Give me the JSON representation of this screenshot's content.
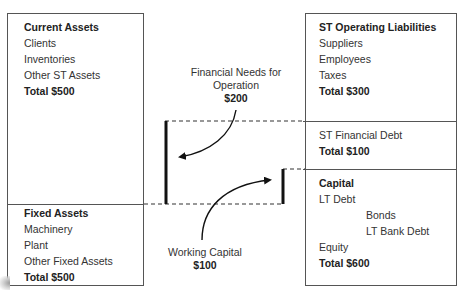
{
  "assets": {
    "current": {
      "title": "Current Assets",
      "items": [
        "Clients",
        "Inventories",
        "Other ST Assets"
      ],
      "total": "Total $500"
    },
    "fixed": {
      "title": "Fixed Assets",
      "items": [
        "Machinery",
        "Plant",
        "Other Fixed Assets"
      ],
      "total": "Total $500"
    }
  },
  "liabilities": {
    "st_operating": {
      "title": "ST Operating Liabilities",
      "items": [
        "Suppliers",
        "Employees",
        "Taxes"
      ],
      "total": "Total $300"
    },
    "st_financial": {
      "items": [
        "ST Financial Debt"
      ],
      "total": "Total $100"
    },
    "capital": {
      "title": "Capital",
      "items": [
        "LT Debt",
        "Bonds",
        "LT Bank Debt",
        "Equity"
      ],
      "total": "Total $600"
    }
  },
  "annotations": {
    "financial_needs": {
      "line1": "Financial Needs for",
      "line2": "Operation",
      "value": "$200"
    },
    "working_capital": {
      "line1": "Working Capital",
      "value": "$100"
    }
  },
  "colors": {
    "border": "#555555",
    "bar": "#111111",
    "text": "#333333"
  }
}
